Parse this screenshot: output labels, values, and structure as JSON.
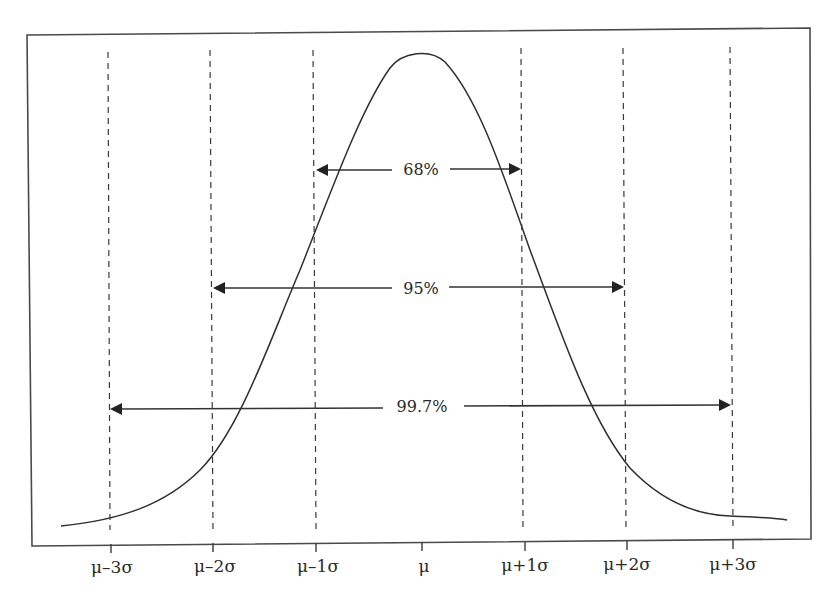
{
  "diagram": {
    "type": "normal-distribution-empirical-rule",
    "axis_ticks": [
      {
        "label": "μ–3σ",
        "x": 109
      },
      {
        "label": "μ–2σ",
        "x": 212
      },
      {
        "label": "μ–1σ",
        "x": 316
      },
      {
        "label": "μ",
        "x": 419
      },
      {
        "label": "μ+1σ",
        "x": 521
      },
      {
        "label": "μ+2σ",
        "x": 625
      },
      {
        "label": "μ+3σ",
        "x": 731
      }
    ],
    "intervals": [
      {
        "label": "68%",
        "from": "μ–1σ",
        "to": "μ+1σ",
        "y": 170,
        "x1": 316,
        "x2": 521
      },
      {
        "label": "95%",
        "from": "μ–2σ",
        "to": "μ+2σ",
        "y": 288,
        "x1": 212,
        "x2": 625
      },
      {
        "label": "99.7%",
        "from": "μ–3σ",
        "to": "μ+3σ",
        "y": 406,
        "x1": 109,
        "x2": 731
      }
    ],
    "colors": {
      "line": "#2f2f2f",
      "background": "#ffffff"
    }
  }
}
